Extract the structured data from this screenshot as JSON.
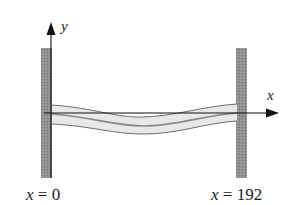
{
  "figure": {
    "axes": {
      "x_label": "x",
      "y_label": "y"
    },
    "supports": [
      {
        "name": "left-wall",
        "position_label_var": "x",
        "position_label_eq": "= 0",
        "position": 0
      },
      {
        "name": "right-wall",
        "position_label_var": "x",
        "position_label_eq": "= 192",
        "position": 192
      }
    ],
    "colors": {
      "wall_fill": "#8c8c8c",
      "beam_fill": "#e6e6e6",
      "beam_outline": "#6e6e6e",
      "axis": "#111111",
      "text": "#1a1a1a"
    }
  }
}
